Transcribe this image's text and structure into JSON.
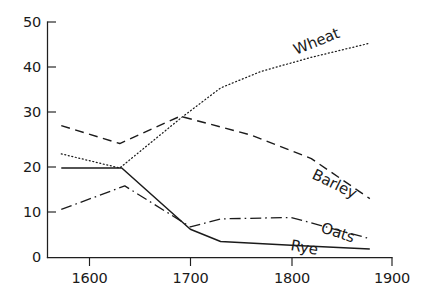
{
  "chart_data": {
    "type": "line",
    "title": "",
    "subtitle": "",
    "xlabel": "",
    "ylabel": "",
    "xlim": [
      1570,
      1900
    ],
    "ylim": [
      0,
      50
    ],
    "grid": false,
    "legend_position": "inline-labels",
    "x_ticks": [
      1600,
      1700,
      1800,
      1900
    ],
    "x_tick_labels": [
      "1600",
      "1700",
      "1800",
      "1900"
    ],
    "y_ticks": [
      0,
      10,
      20,
      30,
      40,
      50
    ],
    "y_tick_labels": [
      "0",
      "10",
      "20",
      "30",
      "40",
      "50"
    ],
    "series": [
      {
        "name": "Wheat",
        "label": "Wheat",
        "line_style": "dotted",
        "color": "#1b1b1b",
        "label_angle_deg": -22,
        "x": [
          1572,
          1630,
          1690,
          1730,
          1770,
          1820,
          1878
        ],
        "values": [
          22.0,
          19.0,
          29.5,
          36.0,
          39.5,
          42.5,
          45.5
        ]
      },
      {
        "name": "Barley",
        "label": "Barley",
        "line_style": "dashed",
        "color": "#1b1b1b",
        "label_angle_deg": 26,
        "x": [
          1572,
          1630,
          1690,
          1760,
          1820,
          1878
        ],
        "values": [
          28.0,
          24.2,
          30.0,
          26.0,
          21.0,
          12.5
        ]
      },
      {
        "name": "Oats",
        "label": "Oats",
        "line_style": "dash-dot",
        "color": "#1b1b1b",
        "label_angle_deg": 18,
        "x": [
          1572,
          1635,
          1700,
          1730,
          1800,
          1878
        ],
        "values": [
          10.2,
          15.2,
          6.5,
          8.2,
          8.5,
          4.0
        ]
      },
      {
        "name": "Rye",
        "label": "Rye",
        "line_style": "solid",
        "color": "#1b1b1b",
        "label_angle_deg": 10,
        "x": [
          1572,
          1632,
          1700,
          1730,
          1800,
          1878
        ],
        "values": [
          19.0,
          19.0,
          6.0,
          3.4,
          2.6,
          1.8
        ]
      }
    ]
  },
  "labels": {
    "wheat": "Wheat",
    "barley": "Barley",
    "oats": "Oats",
    "rye": "Rye"
  },
  "axes": {
    "y_50": "50",
    "y_40": "40",
    "y_30": "30",
    "y_20": "20",
    "y_10": "10",
    "y_0": "0",
    "x_1600": "1600",
    "x_1700": "1700",
    "x_1800": "1800",
    "x_1900": "1900"
  },
  "colors": {
    "ink": "#1b1b1b",
    "background": "#ffffff"
  }
}
